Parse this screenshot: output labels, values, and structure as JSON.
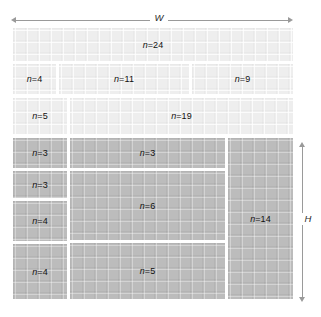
{
  "figure": {
    "title": "",
    "width_label": "W",
    "height_label": "H"
  },
  "chart_data": {
    "type": "treemap",
    "title": "",
    "xlabel": "W",
    "ylabel": "H",
    "grid": false,
    "legend": null,
    "colors": {
      "light_fill": "#eeeeee",
      "dark_fill": "#bcbcbc",
      "gap": "#ffffff",
      "arrow": "#9a9a9a",
      "label_text": "#111111"
    },
    "axis_ranges": {
      "x": [
        0,
        280
      ],
      "y": [
        0,
        271
      ]
    },
    "rects": [
      {
        "id": "r1",
        "label": "n=24",
        "n": 24,
        "tone": "light",
        "x": 0,
        "y": 0,
        "w": 280,
        "h": 33
      },
      {
        "id": "r2",
        "label": "n=4",
        "n": 4,
        "tone": "light",
        "x": 0,
        "y": 36,
        "w": 43,
        "h": 30
      },
      {
        "id": "r3",
        "label": "n=11",
        "n": 11,
        "tone": "light",
        "x": 46,
        "y": 36,
        "w": 130,
        "h": 30
      },
      {
        "id": "r4",
        "label": "n=9",
        "n": 9,
        "tone": "light",
        "x": 179,
        "y": 36,
        "w": 101,
        "h": 30
      },
      {
        "id": "r5",
        "label": "n=5",
        "n": 5,
        "tone": "light",
        "x": 0,
        "y": 70,
        "w": 54,
        "h": 36
      },
      {
        "id": "r6",
        "label": "n=19",
        "n": 19,
        "tone": "light",
        "x": 57,
        "y": 70,
        "w": 223,
        "h": 36
      },
      {
        "id": "r7",
        "label": "n=3",
        "n": 3,
        "tone": "dark",
        "x": 0,
        "y": 110,
        "w": 54,
        "h": 30
      },
      {
        "id": "r8",
        "label": "n=3",
        "n": 3,
        "tone": "dark",
        "x": 57,
        "y": 110,
        "w": 155,
        "h": 30
      },
      {
        "id": "r9",
        "label": "n=3",
        "n": 3,
        "tone": "dark",
        "x": 0,
        "y": 143,
        "w": 54,
        "h": 27
      },
      {
        "id": "r10",
        "label": "n=6",
        "n": 6,
        "tone": "dark",
        "x": 57,
        "y": 143,
        "w": 155,
        "h": 69
      },
      {
        "id": "r11",
        "label": "n=4",
        "n": 4,
        "tone": "dark",
        "x": 0,
        "y": 173,
        "w": 54,
        "h": 40
      },
      {
        "id": "r12",
        "label": "n=5",
        "n": 5,
        "tone": "dark",
        "x": 57,
        "y": 215,
        "w": 155,
        "h": 56
      },
      {
        "id": "r13",
        "label": "n=4",
        "n": 4,
        "tone": "dark",
        "x": 0,
        "y": 216,
        "w": 54,
        "h": 55
      },
      {
        "id": "r14",
        "label": "n=14",
        "n": 14,
        "tone": "dark",
        "x": 215,
        "y": 110,
        "w": 65,
        "h": 161
      }
    ],
    "values": [
      24,
      4,
      11,
      9,
      5,
      19,
      3,
      3,
      3,
      6,
      4,
      5,
      4,
      14
    ],
    "categories": [
      "n=24",
      "n=4",
      "n=11",
      "n=9",
      "n=5",
      "n=19",
      "n=3",
      "n=3",
      "n=3",
      "n=6",
      "n=4",
      "n=5",
      "n=4",
      "n=14"
    ]
  }
}
